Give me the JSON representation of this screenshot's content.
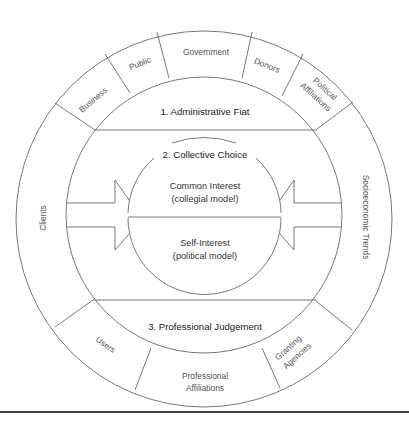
{
  "diagram": {
    "outer_ring": {
      "segments": [
        {
          "label": "Business"
        },
        {
          "label": "Public"
        },
        {
          "label": "Government"
        },
        {
          "label": "Donors"
        },
        {
          "label_line1": "Political",
          "label_line2": "Affiliations"
        },
        {
          "label": "Socioeconomic Trends"
        },
        {
          "label_line1": "Granting",
          "label_line2": "Agencies"
        },
        {
          "label_line1": "Professional",
          "label_line2": "Affiliations"
        },
        {
          "label": "Users"
        },
        {
          "label": "Clients"
        }
      ]
    },
    "decision_modes": {
      "top": "1. Administrative Fiat",
      "middle": "2. Collective Choice",
      "bottom": "3. Professional Judgement"
    },
    "core": {
      "upper_line1": "Common Interest",
      "upper_line2": "(collegial model)",
      "lower_line1": "Self-Interest",
      "lower_line2": "(political model)"
    },
    "colors": {
      "stroke": "#555555",
      "text": "#333333",
      "background": "#ffffff",
      "bottom_rule": "#444444"
    }
  }
}
